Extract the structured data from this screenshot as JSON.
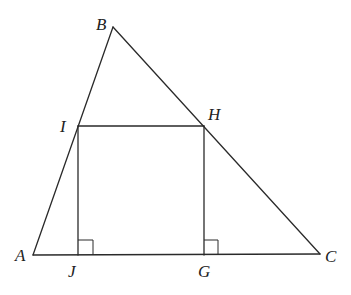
{
  "diagram": {
    "type": "geometry",
    "colors": {
      "stroke": "#2a2a2a",
      "label": "#222222",
      "background": "#ffffff"
    },
    "points": {
      "A": {
        "label": "A",
        "x": 33,
        "y": 255
      },
      "B": {
        "label": "B",
        "x": 113,
        "y": 27
      },
      "C": {
        "label": "C",
        "x": 320,
        "y": 254
      },
      "I": {
        "label": "I",
        "x": 78,
        "y": 126
      },
      "H": {
        "label": "H",
        "x": 204,
        "y": 126
      },
      "J": {
        "label": "J",
        "x": 78,
        "y": 255
      },
      "G": {
        "label": "G",
        "x": 204,
        "y": 255
      }
    },
    "segments": [
      [
        "A",
        "B"
      ],
      [
        "B",
        "C"
      ],
      [
        "A",
        "C"
      ],
      [
        "I",
        "H"
      ],
      [
        "I",
        "J"
      ],
      [
        "H",
        "G"
      ]
    ],
    "right_angle_marks": [
      "J",
      "G"
    ],
    "labels": {
      "A": "A",
      "B": "B",
      "C": "C",
      "I": "I",
      "H": "H",
      "J": "J",
      "G": "G"
    }
  }
}
